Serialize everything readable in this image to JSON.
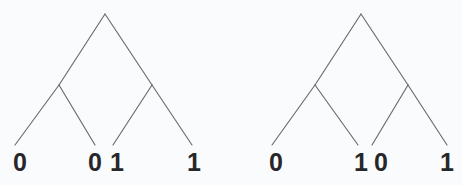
{
  "figure": {
    "kind": "binary-tree-pair",
    "background_color": "#fafbfc",
    "edge_color": "#6a6a72",
    "label_color": "#27272b"
  },
  "trees": [
    {
      "name": "left-tree",
      "root": {
        "x": 105,
        "y": 14
      },
      "internal_nodes": [
        {
          "name": "left-internal-node",
          "x": 59,
          "y": 85
        },
        {
          "name": "right-internal-node",
          "x": 152,
          "y": 85
        }
      ],
      "leaves": [
        {
          "name": "leaf-1",
          "label": "0",
          "x": 15,
          "y": 145,
          "label_x": 7,
          "label_y": 150
        },
        {
          "name": "leaf-2",
          "label": "0",
          "x": 95,
          "y": 145,
          "label_x": 82,
          "label_y": 150
        },
        {
          "name": "leaf-3",
          "label": "1",
          "x": 113,
          "y": 145,
          "label_x": 104,
          "label_y": 150
        },
        {
          "name": "leaf-4",
          "label": "1",
          "x": 192,
          "y": 145,
          "label_x": 181,
          "label_y": 150
        }
      ],
      "leaf_sequence": "0 0 1 1"
    },
    {
      "name": "right-tree",
      "root": {
        "x": 361,
        "y": 14
      },
      "internal_nodes": [
        {
          "name": "left-internal-node",
          "x": 315,
          "y": 85
        },
        {
          "name": "right-internal-node",
          "x": 408,
          "y": 85
        }
      ],
      "leaves": [
        {
          "name": "leaf-1",
          "label": "0",
          "x": 272,
          "y": 145,
          "label_x": 263,
          "label_y": 150
        },
        {
          "name": "leaf-2",
          "label": "1",
          "x": 358,
          "y": 145,
          "label_x": 348,
          "label_y": 150
        },
        {
          "name": "leaf-3",
          "label": "0",
          "x": 372,
          "y": 145,
          "label_x": 368,
          "label_y": 150
        },
        {
          "name": "leaf-4",
          "label": "1",
          "x": 447,
          "y": 145,
          "label_x": 434,
          "label_y": 150
        }
      ],
      "leaf_sequence": "0 1 0 1"
    }
  ]
}
